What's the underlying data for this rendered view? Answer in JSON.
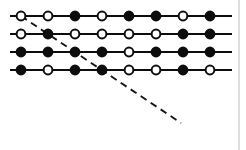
{
  "figure": {
    "background_color": "#ffffff",
    "width": 246,
    "height": 150,
    "node_colors": {
      "filled": "#0d0d0d",
      "open": "#ffffff",
      "outline": "#0d0d0d"
    },
    "line_color": "#0d0d0d",
    "dashed_line_color": "#15151a",
    "frame_edge_color": "#c9c9cf"
  },
  "chart_data": {
    "type": "diagram",
    "xlabel": "",
    "ylabel": "",
    "grid": false,
    "legend": null,
    "geometry": {
      "node_radius": 4.6,
      "open_node_radius": 4.4,
      "column_spacing": 27,
      "row_spacing": 18,
      "first_column_x": 21,
      "first_row_y": 16,
      "columns": 8,
      "rows": 4,
      "line_start_x": 10,
      "line_end_x": 232
    },
    "rows": [
      {
        "index": 1,
        "y": 16,
        "states": [
          "open",
          "open",
          "filled",
          "open",
          "filled",
          "filled",
          "open",
          "filled"
        ]
      },
      {
        "index": 2,
        "y": 34,
        "states": [
          "open",
          "filled",
          "open",
          "open",
          "open",
          "open",
          "filled",
          "filled"
        ]
      },
      {
        "index": 3,
        "y": 52,
        "states": [
          "filled",
          "filled",
          "filled",
          "filled",
          "open",
          "filled",
          "filled",
          "filled"
        ]
      },
      {
        "index": 4,
        "y": 70,
        "states": [
          "filled",
          "open",
          "filled",
          "filled",
          "open",
          "open",
          "filled",
          "open"
        ]
      }
    ],
    "dashed_line": {
      "label": "cut line",
      "x1": 21,
      "y1": 16,
      "x2": 181,
      "y2": 123,
      "dash_pattern": "7 5",
      "passes_through_nodes": [
        {
          "row": 1,
          "column": 1
        },
        {
          "row": 2,
          "column": 2
        },
        {
          "row": 3,
          "column": 3
        },
        {
          "row": 4,
          "column": 4
        }
      ]
    },
    "frame_edge": {
      "x": 239,
      "y1": 0,
      "y2": 150
    }
  }
}
